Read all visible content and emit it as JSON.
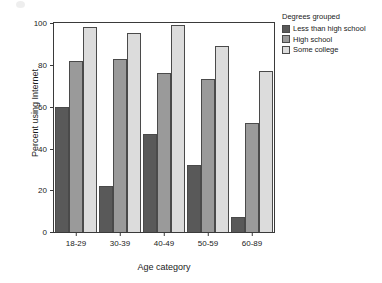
{
  "chart_data": {
    "type": "bar",
    "title": "",
    "xlabel": "Age category",
    "ylabel": "Percent using Internet",
    "categories": [
      "18-29",
      "30-39",
      "40-49",
      "50-59",
      "60-89"
    ],
    "series": [
      {
        "name": "Less than high school",
        "color": "#595959",
        "values": [
          60,
          22,
          47,
          32,
          7
        ]
      },
      {
        "name": "High school",
        "color": "#9a9a9a",
        "values": [
          82,
          83,
          76,
          73,
          52
        ]
      },
      {
        "name": "Some college",
        "color": "#dcdcdc",
        "values": [
          98,
          95,
          99,
          89,
          77
        ]
      }
    ],
    "ylim": [
      0,
      100
    ],
    "yticks": [
      0,
      20,
      40,
      60,
      80,
      100
    ],
    "grid": false,
    "legend_position": "right",
    "legend_title": "Degrees grouped"
  },
  "legend": {
    "title": "Degrees grouped",
    "items": [
      {
        "label": "Less than high school"
      },
      {
        "label": "High school"
      },
      {
        "label": "Some college"
      }
    ]
  },
  "axes": {
    "y_title": "Percent using Internet",
    "x_title": "Age category"
  }
}
